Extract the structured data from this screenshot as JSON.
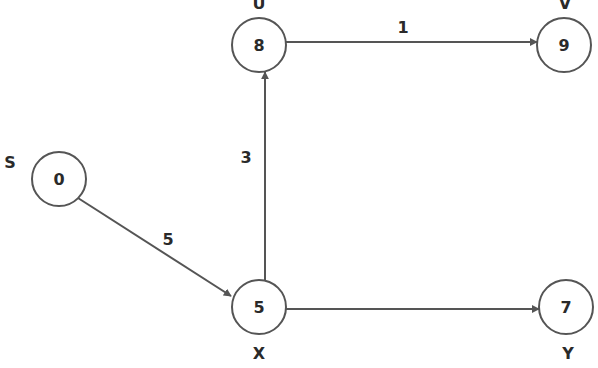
{
  "graph": {
    "type": "directed-weighted",
    "colors": {
      "stroke": "#555555",
      "text": "#2a2a2a",
      "background": "#ffffff"
    },
    "nodes": [
      {
        "id": "S",
        "name": "S",
        "value": "0",
        "cx": 59,
        "cy": 179,
        "label_x": 10,
        "label_y": 167
      },
      {
        "id": "U",
        "name": "U",
        "value": "8",
        "cx": 259,
        "cy": 45,
        "label_x": 259,
        "label_y": 8
      },
      {
        "id": "V",
        "name": "V",
        "value": "9",
        "cx": 564,
        "cy": 45,
        "label_x": 564,
        "label_y": 8
      },
      {
        "id": "X",
        "name": "X",
        "value": "5",
        "cx": 259,
        "cy": 307,
        "label_x": 259,
        "label_y": 357
      },
      {
        "id": "Y",
        "name": "Y",
        "value": "7",
        "cx": 566,
        "cy": 307,
        "label_x": 568,
        "label_y": 357
      }
    ],
    "edges": [
      {
        "from": "S",
        "to": "X",
        "weight": "5",
        "label_x": 168,
        "label_y": 245
      },
      {
        "from": "X",
        "to": "U",
        "weight": "3",
        "label_x": 246,
        "label_y": 163
      },
      {
        "from": "U",
        "to": "V",
        "weight": "1",
        "label_x": 403,
        "label_y": 33
      },
      {
        "from": "X",
        "to": "Y",
        "weight": "",
        "label_x": 412,
        "label_y": 300
      }
    ]
  }
}
